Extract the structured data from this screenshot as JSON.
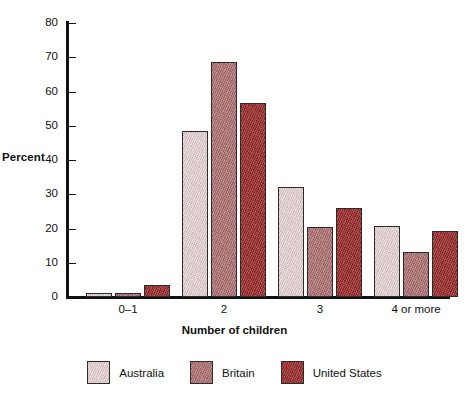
{
  "chart_data": {
    "type": "bar",
    "title": "",
    "subtitle": "",
    "xlabel": "Number of children",
    "ylabel": "Percent",
    "categories": [
      "0–1",
      "2",
      "3",
      "4 or more"
    ],
    "series": [
      {
        "name": "Australia",
        "color": "#dcc3c4",
        "values": [
          1.2,
          48.6,
          32.1,
          20.7
        ]
      },
      {
        "name": "Britain",
        "color": "#b06a6c",
        "values": [
          1.1,
          68.5,
          20.5,
          13.2
        ]
      },
      {
        "name": "United States",
        "color": "#a32525",
        "values": [
          3.5,
          56.6,
          26.1,
          19.4
        ]
      }
    ],
    "ylim": [
      0,
      80
    ],
    "yticks": [
      0,
      10,
      20,
      30,
      40,
      50,
      60,
      70,
      80
    ],
    "ytick_labels": [
      "0",
      "10",
      "20",
      "30",
      "40",
      "50",
      "60",
      "70",
      "80"
    ],
    "grid": false,
    "legend_position": "bottom"
  },
  "axes": {
    "y_title": "Percent",
    "x_title": "Number of children"
  },
  "legend": {
    "entries": [
      {
        "label": "Australia",
        "color": "#dcc3c4"
      },
      {
        "label": "Britain",
        "color": "#b06a6c"
      },
      {
        "label": "United States",
        "color": "#a32525"
      }
    ]
  }
}
